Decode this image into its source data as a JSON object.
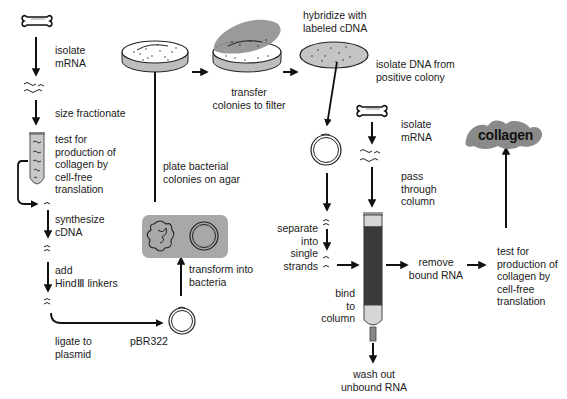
{
  "diagram": {
    "type": "flowchart",
    "colors": {
      "ink": "#111111",
      "gray_fill": "#9a9a9a",
      "light_fill": "#d9d9d9",
      "box_fill": "#a8a8a8",
      "column_dark": "#3a3a3a"
    },
    "left_column": {
      "isolate_mrna": "isolate\nmRNA",
      "size_fractionate": "size fractionate",
      "test_translation": "test for\nproduction of\ncollagen by\ncell-free\ntranslation",
      "synthesize_cdna": "synthesize\ncDNA",
      "add_linkers": "add\nHindⅢ linkers",
      "ligate": "ligate to\nplasmid"
    },
    "middle": {
      "plasmid_label": "pBR322",
      "transform": "transform into\nbacteria",
      "plate": "plate bacterial\ncolonies on agar",
      "transfer": "transfer\ncolonies to filter"
    },
    "right": {
      "hybridize": "hybridize with\nlabeled cDNA",
      "isolate_dna": "isolate DNA from\npositive colony",
      "separate": "separate\ninto\nsingle\nstrands",
      "bind": "bind\nto\ncolumn",
      "isolate_mrna2": "isolate\nmRNA",
      "pass_column": "pass\nthrough\ncolumn",
      "wash_out": "wash out\nunbound RNA",
      "remove_bound": "remove\nbound RNA",
      "test_translation2": "test for\nproduction of\ncollagen by\ncell-free\ntranslation",
      "product": "collagen"
    },
    "icons": [
      "bone-icon",
      "mrna-squiggle-icon",
      "test-tube-icon",
      "cdna-strand-icon",
      "plasmid-circle-icon",
      "bacterium-icon",
      "petri-dish-icon",
      "filter-disc-icon",
      "affinity-column-icon",
      "protein-blob-icon"
    ]
  }
}
